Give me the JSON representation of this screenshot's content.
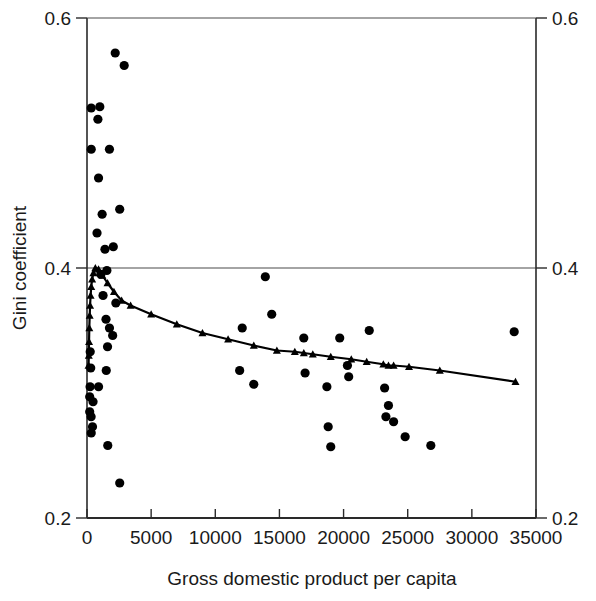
{
  "chart_data": {
    "type": "scatter",
    "title": "",
    "xlabel": "Gross domestic product per capita",
    "ylabel": "Gini coefficient",
    "xlim": [
      0,
      35000
    ],
    "ylim": [
      0.2,
      0.6
    ],
    "xticks": [
      0,
      5000,
      10000,
      15000,
      20000,
      25000,
      30000,
      35000
    ],
    "xtick_labels": [
      "0",
      "5000",
      "10000",
      "15000",
      "20000",
      "25000",
      "30000",
      "35000"
    ],
    "yticks": [
      0.2,
      0.4,
      0.6
    ],
    "ytick_labels": [
      "0.2",
      "0.4",
      "0.6"
    ],
    "yticks_right": [
      0.2,
      0.4,
      0.6
    ],
    "ytick_labels_right": [
      "0.2",
      "0.4",
      "0.6"
    ],
    "grid": false,
    "gridlines_y": [
      0.4
    ],
    "legend": null,
    "series": [
      {
        "name": "Country observations",
        "marker": "circle",
        "color": "#000000",
        "points": [
          [
            2200,
            0.572
          ],
          [
            2900,
            0.562
          ],
          [
            330,
            0.528
          ],
          [
            1000,
            0.529
          ],
          [
            850,
            0.519
          ],
          [
            330,
            0.495
          ],
          [
            1750,
            0.495
          ],
          [
            900,
            0.472
          ],
          [
            1180,
            0.443
          ],
          [
            2550,
            0.447
          ],
          [
            780,
            0.428
          ],
          [
            1400,
            0.415
          ],
          [
            2050,
            0.417
          ],
          [
            1550,
            0.398
          ],
          [
            1080,
            0.395
          ],
          [
            1250,
            0.378
          ],
          [
            2250,
            0.372
          ],
          [
            1480,
            0.359
          ],
          [
            1750,
            0.352
          ],
          [
            2000,
            0.346
          ],
          [
            1600,
            0.337
          ],
          [
            250,
            0.333
          ],
          [
            290,
            0.32
          ],
          [
            1500,
            0.318
          ],
          [
            240,
            0.305
          ],
          [
            900,
            0.305
          ],
          [
            210,
            0.297
          ],
          [
            470,
            0.293
          ],
          [
            210,
            0.285
          ],
          [
            320,
            0.281
          ],
          [
            430,
            0.273
          ],
          [
            330,
            0.268
          ],
          [
            1620,
            0.258
          ],
          [
            2550,
            0.228
          ],
          [
            11900,
            0.318
          ],
          [
            12100,
            0.352
          ],
          [
            13000,
            0.307
          ],
          [
            13900,
            0.393
          ],
          [
            14400,
            0.363
          ],
          [
            16900,
            0.344
          ],
          [
            17000,
            0.316
          ],
          [
            18700,
            0.305
          ],
          [
            18800,
            0.273
          ],
          [
            19000,
            0.257
          ],
          [
            19700,
            0.344
          ],
          [
            20300,
            0.322
          ],
          [
            20400,
            0.313
          ],
          [
            22000,
            0.35
          ],
          [
            23200,
            0.304
          ],
          [
            23300,
            0.281
          ],
          [
            23500,
            0.29
          ],
          [
            23900,
            0.277
          ],
          [
            24800,
            0.265
          ],
          [
            26800,
            0.258
          ],
          [
            33300,
            0.349
          ]
        ]
      },
      {
        "name": "Fitted curve",
        "marker": "triangle",
        "color": "#000000",
        "line": true,
        "points": [
          [
            120,
            0.322
          ],
          [
            140,
            0.33
          ],
          [
            160,
            0.341
          ],
          [
            180,
            0.352
          ],
          [
            210,
            0.362
          ],
          [
            240,
            0.37
          ],
          [
            280,
            0.378
          ],
          [
            330,
            0.385
          ],
          [
            400,
            0.391
          ],
          [
            500,
            0.396
          ],
          [
            650,
            0.4
          ],
          [
            900,
            0.399
          ],
          [
            1200,
            0.394
          ],
          [
            1600,
            0.388
          ],
          [
            2100,
            0.381
          ],
          [
            2700,
            0.374
          ],
          [
            3400,
            0.37
          ],
          [
            5000,
            0.363
          ],
          [
            7000,
            0.355
          ],
          [
            9000,
            0.348
          ],
          [
            11000,
            0.343
          ],
          [
            13000,
            0.338
          ],
          [
            14800,
            0.334
          ],
          [
            16200,
            0.333
          ],
          [
            16900,
            0.332
          ],
          [
            17600,
            0.331
          ],
          [
            19000,
            0.329
          ],
          [
            20600,
            0.327
          ],
          [
            21800,
            0.325
          ],
          [
            23100,
            0.323
          ],
          [
            23500,
            0.322
          ],
          [
            23900,
            0.322
          ],
          [
            25100,
            0.321
          ],
          [
            27500,
            0.318
          ],
          [
            33400,
            0.309
          ]
        ]
      }
    ]
  }
}
